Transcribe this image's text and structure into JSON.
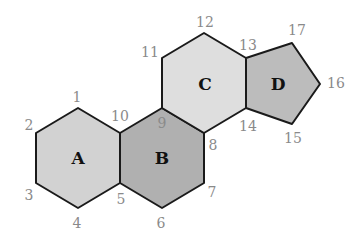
{
  "diagram": {
    "colors": {
      "A": "#d2d2d2",
      "B": "#b0b0b0",
      "C": "#dedede",
      "D": "#bcbcbc",
      "stroke": "#1a1a1a",
      "vertex_label": "#8a8a8a"
    },
    "regions": [
      {
        "name": "A",
        "label": "A",
        "vertices": [
          1,
          10,
          5,
          4,
          3,
          2
        ]
      },
      {
        "name": "B",
        "label": "B",
        "vertices": [
          10,
          9,
          8,
          7,
          6,
          5
        ]
      },
      {
        "name": "C",
        "label": "C",
        "vertices": [
          11,
          12,
          13,
          14,
          8,
          9
        ]
      },
      {
        "name": "D",
        "label": "D",
        "vertices": [
          13,
          17,
          16,
          15,
          14
        ]
      }
    ],
    "vertex_labels": {
      "v1": "1",
      "v2": "2",
      "v3": "3",
      "v4": "4",
      "v5": "5",
      "v6": "6",
      "v7": "7",
      "v8": "8",
      "v9": "9",
      "v10": "10",
      "v11": "11",
      "v12": "12",
      "v13": "13",
      "v14": "14",
      "v15": "15",
      "v16": "16",
      "v17": "17"
    }
  }
}
